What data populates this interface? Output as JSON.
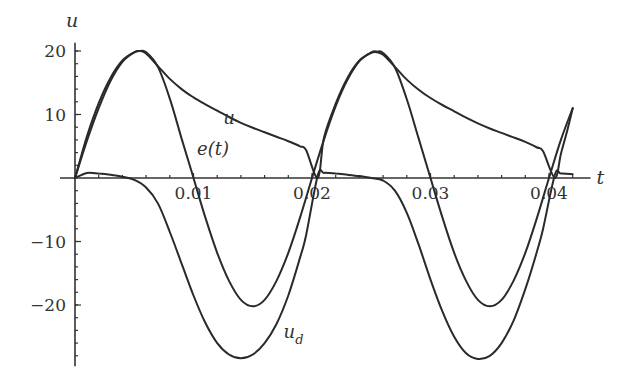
{
  "chart_data": {
    "type": "line",
    "title": "",
    "xlabel": "t",
    "ylabel": "u",
    "xlim": [
      0,
      0.043
    ],
    "ylim": [
      -29,
      21
    ],
    "grid": false,
    "legend": "none (inline curve labels)",
    "x_ticks": [
      {
        "value": 0.01,
        "label": "0.01"
      },
      {
        "value": 0.02,
        "label": "0.02"
      },
      {
        "value": 0.03,
        "label": "0.03"
      },
      {
        "value": 0.04,
        "label": "0.04"
      }
    ],
    "y_ticks": [
      {
        "value": 20,
        "label": "20"
      },
      {
        "value": 10,
        "label": "10"
      },
      {
        "value": -10,
        "label": "−10"
      },
      {
        "value": -20,
        "label": "−20"
      }
    ],
    "x_minor_step": 0.002,
    "y_minor_step": 2,
    "series": [
      {
        "name": "u",
        "label": "u",
        "x": [
          0,
          0.001,
          0.002,
          0.003,
          0.004,
          0.005,
          0.0055,
          0.006,
          0.007,
          0.008,
          0.009,
          0.01,
          0.011,
          0.012,
          0.013,
          0.014,
          0.015,
          0.016,
          0.017,
          0.018,
          0.019,
          0.0195,
          0.0205,
          0.021,
          0.022,
          0.023,
          0.024,
          0.025,
          0.0255,
          0.026,
          0.027,
          0.028,
          0.029,
          0.03,
          0.031,
          0.032,
          0.033,
          0.034,
          0.035,
          0.036,
          0.037,
          0.038,
          0.039,
          0.0395,
          0.0405,
          0.041,
          0.0415,
          0.042
        ],
        "y": [
          0,
          6.5,
          11.8,
          15.8,
          18.5,
          19.8,
          20,
          19.6,
          17.6,
          15.6,
          14,
          12.7,
          11.6,
          10.6,
          9.6,
          8.7,
          7.9,
          7.2,
          6.5,
          5.8,
          5,
          4.4,
          0,
          6.3,
          11.7,
          15.8,
          18.5,
          19.7,
          19.8,
          19.4,
          17.5,
          15.5,
          13.9,
          12.6,
          11.5,
          10.5,
          9.5,
          8.6,
          7.8,
          7.1,
          6.4,
          5.7,
          4.8,
          4.2,
          0,
          3.8,
          7.2,
          11
        ]
      },
      {
        "name": "e(t)",
        "label": "e(t)",
        "x": [
          0,
          0.001,
          0.002,
          0.003,
          0.004,
          0.005,
          0.0055,
          0.006,
          0.007,
          0.008,
          0.009,
          0.01,
          0.011,
          0.012,
          0.013,
          0.014,
          0.015,
          0.016,
          0.017,
          0.018,
          0.019,
          0.02,
          0.021,
          0.022,
          0.023,
          0.024,
          0.025,
          0.0255,
          0.026,
          0.027,
          0.028,
          0.029,
          0.03,
          0.031,
          0.032,
          0.033,
          0.034,
          0.035,
          0.036,
          0.037,
          0.038,
          0.039,
          0.04,
          0.041,
          0.042
        ],
        "y": [
          0,
          5.8,
          11,
          15.3,
          18.3,
          19.8,
          20,
          19.8,
          17.5,
          12.5,
          6.2,
          0,
          -6.2,
          -11.8,
          -16.2,
          -19.2,
          -20.2,
          -19.2,
          -16.2,
          -11.8,
          -6.2,
          0,
          6,
          11.3,
          15.5,
          18.4,
          19.8,
          19.9,
          19.7,
          17.4,
          12.4,
          6.2,
          0,
          -6.2,
          -11.8,
          -16.2,
          -19.2,
          -20.2,
          -19.2,
          -16.2,
          -11.8,
          -6.2,
          0,
          6,
          11
        ]
      },
      {
        "name": "u_d",
        "label": "u_d",
        "x": [
          0,
          0.001,
          0.002,
          0.003,
          0.004,
          0.005,
          0.006,
          0.007,
          0.008,
          0.009,
          0.01,
          0.011,
          0.012,
          0.013,
          0.014,
          0.015,
          0.016,
          0.017,
          0.018,
          0.019,
          0.0195,
          0.0205,
          0.021,
          0.022,
          0.023,
          0.024,
          0.025,
          0.026,
          0.027,
          0.028,
          0.029,
          0.03,
          0.031,
          0.032,
          0.033,
          0.034,
          0.035,
          0.036,
          0.037,
          0.038,
          0.039,
          0.0395,
          0.0405,
          0.041,
          0.042
        ],
        "y": [
          0,
          0.8,
          0.7,
          0.5,
          0.2,
          -0.3,
          -1.5,
          -4,
          -8.5,
          -13.5,
          -18.5,
          -22.8,
          -26,
          -27.8,
          -28.4,
          -27.8,
          -26,
          -23,
          -18.5,
          -12.5,
          -9,
          0.5,
          0.8,
          0.7,
          0.5,
          0.3,
          0,
          -0.4,
          -2,
          -5.5,
          -10.5,
          -16,
          -21,
          -25,
          -27.6,
          -28.5,
          -28,
          -26,
          -22.5,
          -17.5,
          -11.5,
          -8,
          0.5,
          0.7,
          0.6
        ]
      }
    ],
    "annotations": [
      {
        "text": "u",
        "near_series": "u",
        "at": [
          0.0125,
          8.5
        ]
      },
      {
        "text": "e(t)",
        "near_series": "e(t)",
        "at": [
          0.0103,
          3.7
        ]
      },
      {
        "text": "u",
        "subscript": "d",
        "near_series": "u_d",
        "at": [
          0.0176,
          -25.2
        ]
      }
    ]
  }
}
